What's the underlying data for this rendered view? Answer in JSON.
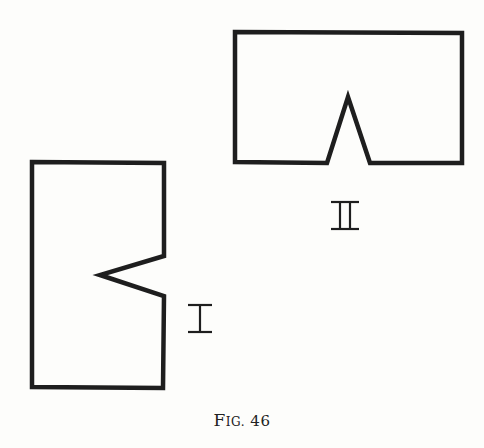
{
  "figure": {
    "caption_prefix_big": "F",
    "caption_prefix_small": "IG.",
    "caption_number": "46",
    "stroke_color": "#1e1e1e",
    "shapes": [
      {
        "label": "II",
        "description": "Wide rectangle with a triangular notch cut upward into the bottom edge",
        "points": "235,32 462,33 462,163 370,163 348,97 327,163 235,162"
      },
      {
        "label": "I",
        "description": "Tall rectangle with a triangular notch cut leftward into the right edge",
        "points": "32,162 164,163 164,256 100,275 164,296 163,388 32,387"
      }
    ]
  }
}
